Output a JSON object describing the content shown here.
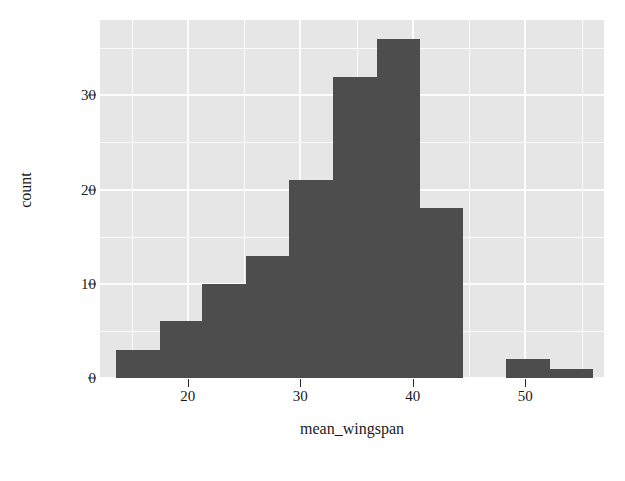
{
  "chart_data": {
    "type": "bar",
    "chart_subtype": "histogram",
    "title": "",
    "subtitle": "",
    "xlabel": "mean_wingspan",
    "ylabel": "count",
    "xlim": [
      12.2,
      57.0
    ],
    "ylim": [
      0,
      38
    ],
    "grid": true,
    "legend": null,
    "legend_position": "none",
    "bar_color": "#4d4d4d",
    "panel_color": "#e6e6e6",
    "gridline_color": "#fdfdfd",
    "bin_width": 4.1,
    "xticks": [
      20,
      30,
      40,
      50
    ],
    "xtick_labels": [
      "20",
      "30",
      "40",
      "50"
    ],
    "yticks": [
      0,
      10,
      20,
      30
    ],
    "ytick_labels": [
      "0",
      "10",
      "20",
      "30"
    ],
    "y_minor_ticks": [
      5,
      15,
      25,
      35
    ],
    "x_minor_ticks": [
      15,
      25,
      35,
      45,
      55
    ],
    "bins": [
      {
        "x0": 13.6,
        "x1": 17.5,
        "count": 3
      },
      {
        "x0": 17.5,
        "x1": 21.3,
        "count": 6
      },
      {
        "x0": 21.3,
        "x1": 25.2,
        "count": 10
      },
      {
        "x0": 25.2,
        "x1": 29.0,
        "count": 13
      },
      {
        "x0": 29.0,
        "x1": 32.9,
        "count": 21
      },
      {
        "x0": 32.9,
        "x1": 36.8,
        "count": 32
      },
      {
        "x0": 36.8,
        "x1": 40.6,
        "count": 36
      },
      {
        "x0": 40.6,
        "x1": 44.5,
        "count": 18
      },
      {
        "x0": 44.5,
        "x1": 48.3,
        "count": 0
      },
      {
        "x0": 48.3,
        "x1": 52.2,
        "count": 2
      },
      {
        "x0": 52.2,
        "x1": 56.0,
        "count": 1
      }
    ],
    "categories": [
      "13.6-17.5",
      "17.5-21.3",
      "21.3-25.2",
      "25.2-29.0",
      "29.0-32.9",
      "32.9-36.8",
      "36.8-40.6",
      "40.6-44.5",
      "44.5-48.3",
      "48.3-52.2",
      "52.2-56.0"
    ],
    "values": [
      3,
      6,
      10,
      13,
      21,
      32,
      36,
      18,
      0,
      2,
      1
    ]
  },
  "axes": {
    "y_title": "count",
    "x_title": "mean_wingspan"
  }
}
